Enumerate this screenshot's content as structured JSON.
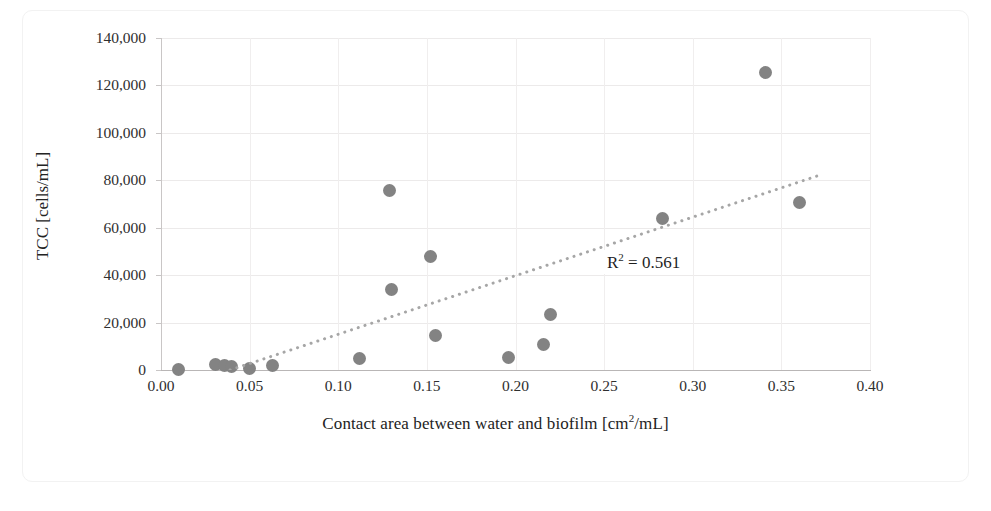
{
  "figure": {
    "background_color": "#ffffff",
    "border_color": "#f2f2f2"
  },
  "chart_data": {
    "type": "scatter",
    "title": "",
    "xlabel": "Contact area between water and biofilm [cm2/mL]",
    "xlabel_main": "Contact area between water and biofilm [cm",
    "xlabel_sup": "2",
    "xlabel_tail": "/mL]",
    "ylabel": "TCC [cells/mL]",
    "xlim": [
      0.0,
      0.4
    ],
    "ylim": [
      0,
      140000
    ],
    "grid": true,
    "grid_axes": "both",
    "legend": "none",
    "marker_color": "#838383",
    "trendline_color": "#a6a6a6",
    "trendline_style": "dotted",
    "xticks": [
      "0.00",
      "0.05",
      "0.10",
      "0.15",
      "0.20",
      "0.25",
      "0.30",
      "0.35",
      "0.40"
    ],
    "xtick_values": [
      0.0,
      0.05,
      0.1,
      0.15,
      0.2,
      0.25,
      0.3,
      0.35,
      0.4
    ],
    "yticks": [
      "0",
      "20,000",
      "40,000",
      "60,000",
      "80,000",
      "100,000",
      "120,000",
      "140,000"
    ],
    "ytick_values": [
      0,
      20000,
      40000,
      60000,
      80000,
      100000,
      120000,
      140000
    ],
    "points": [
      {
        "x": 0.01,
        "y": 300
      },
      {
        "x": 0.031,
        "y": 2200
      },
      {
        "x": 0.036,
        "y": 1800
      },
      {
        "x": 0.04,
        "y": 1400
      },
      {
        "x": 0.05,
        "y": 600
      },
      {
        "x": 0.063,
        "y": 2000
      },
      {
        "x": 0.112,
        "y": 4700
      },
      {
        "x": 0.129,
        "y": 75500
      },
      {
        "x": 0.13,
        "y": 34000
      },
      {
        "x": 0.152,
        "y": 48000
      },
      {
        "x": 0.155,
        "y": 14700
      },
      {
        "x": 0.196,
        "y": 5200
      },
      {
        "x": 0.216,
        "y": 10700
      },
      {
        "x": 0.22,
        "y": 23300
      },
      {
        "x": 0.283,
        "y": 64000
      },
      {
        "x": 0.341,
        "y": 125300
      },
      {
        "x": 0.36,
        "y": 70800
      }
    ],
    "trendline": {
      "x_start": 0.039,
      "y_start": 0,
      "x_end": 0.371,
      "y_end": 82000
    },
    "annotations": [
      {
        "name": "r-squared",
        "text": "R2 = 0.561",
        "text_main": "R",
        "text_sup": "2",
        "text_tail": " = 0.561",
        "value": 0.561
      }
    ]
  }
}
